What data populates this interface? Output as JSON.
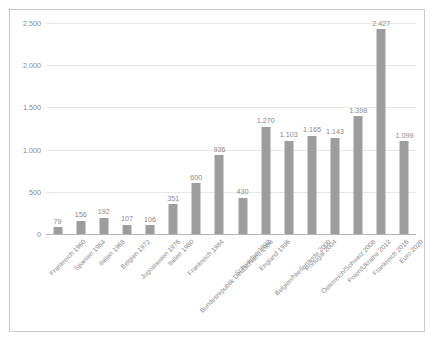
{
  "chart_data": {
    "type": "bar",
    "title": "",
    "subtitle": "",
    "xlabel": "",
    "ylabel": "",
    "ylim": [
      0,
      2500
    ],
    "ytick_values": [
      0,
      500,
      1000,
      1500,
      2000,
      2500
    ],
    "ytick_labels": [
      "0",
      "500",
      "1.000",
      "1.500",
      "2.000",
      "2.500"
    ],
    "grid": true,
    "legend": "none",
    "bar_color": "#9d9d9d",
    "label_color": "#8a8a8a",
    "gridline_color": "#e8e8e8",
    "axis_color": "#b6b6b6",
    "frame_color": "#c8c8c8",
    "categories": [
      "Frankreich 1960",
      "Spanien 1964",
      "Italien 1968",
      "Belgien 1972",
      "Jugoslawien 1976",
      "Italien 1980",
      "Frankreich 1984",
      "Bundesrepublik Deutschland 1988",
      "Schweden 1992",
      "England 1996",
      "Belgien/Niederlande 2000",
      "Portugal 2004",
      "Österreich/Schweiz 2008",
      "Polen/Ukraine 2012",
      "Frankreich 2016",
      "Euro 2020"
    ],
    "values": [
      79,
      156,
      192,
      107,
      106,
      351,
      600,
      936,
      430,
      1270,
      1103,
      1165,
      1143,
      1398,
      2427,
      1099
    ],
    "value_labels": [
      "79",
      "156",
      "192",
      "107",
      "106",
      "351",
      "600",
      "936",
      "430",
      "1.270",
      "1.103",
      "1.165",
      "1.143",
      "1.398",
      "2.427",
      "1.099"
    ]
  }
}
